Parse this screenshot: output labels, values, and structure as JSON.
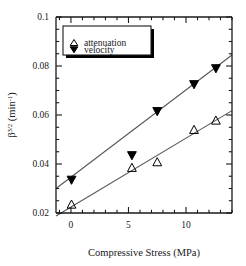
{
  "chart_data": {
    "type": "scatter",
    "title": "",
    "xlabel": "Compressive Stress (MPa)",
    "ylabel": "β",
    "ylabel_sup": "3/2",
    "ylabel_unit": " (min",
    "ylabel_unit_sup": "-1",
    "ylabel_unit_close": ")",
    "xlim": [
      -1.3,
      14.0
    ],
    "ylim": [
      0.02,
      0.1
    ],
    "xticks": [
      0,
      5,
      10
    ],
    "xticklabels": [
      "0",
      "5",
      "10"
    ],
    "xminor_step": 1,
    "yticks": [
      0.02,
      0.04,
      0.06,
      0.08,
      0.1
    ],
    "yticklabels": [
      "0.02",
      "0.04",
      "0.06",
      "0.08",
      "0.1"
    ],
    "yminor_step": 0.005,
    "grid": false,
    "legend_position": "top-left",
    "series": [
      {
        "name": "attenuation",
        "marker": "triangle-up-open",
        "color": "#000000",
        "x": [
          0.05,
          5.3,
          7.5,
          10.7,
          12.6
        ],
        "y": [
          0.0235,
          0.0385,
          0.0408,
          0.054,
          0.0578
        ],
        "fit_line": {
          "x0": -1.3,
          "y0": 0.0188,
          "x1": 14.0,
          "y1": 0.0618
        }
      },
      {
        "name": "velocity",
        "marker": "triangle-down-filled",
        "color": "#000000",
        "x": [
          0.05,
          5.3,
          7.5,
          10.7,
          12.6
        ],
        "y": [
          0.0335,
          0.0435,
          0.0615,
          0.0725,
          0.079
        ],
        "fit_line": {
          "x0": -1.3,
          "y0": 0.03,
          "x1": 14.0,
          "y1": 0.0845
        }
      }
    ]
  },
  "legend": {
    "entries": [
      {
        "label": "attenuation",
        "marker": "triangle-up-open"
      },
      {
        "label": "velocity",
        "marker": "triangle-down-filled"
      }
    ]
  },
  "colors": {
    "axis": "#1a1a1a",
    "marker": "#000000",
    "line": "#555555",
    "legend_border": "#1a1a1a",
    "legend_shadow": "#000000",
    "background": "#ffffff"
  }
}
